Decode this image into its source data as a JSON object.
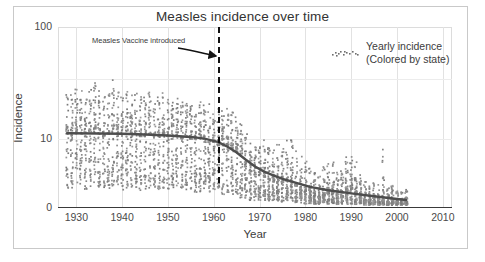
{
  "figure": {
    "title": "Measles incidence over time",
    "background": "#ffffff",
    "frame_color": "#c9c9c9"
  },
  "annotations": {
    "vaccine_label": "Measles Vaccine introduced",
    "vaccine_year": 1961,
    "arrow_color": "#111111",
    "dashed_line_color": "#111111"
  },
  "legend": {
    "title_line1": "Yearly incidence",
    "title_line2": "(Colored by state)",
    "marker": "scatter-dots-marker"
  },
  "chart_data": {
    "type": "scatter",
    "title": "Measles incidence over time",
    "xlabel": "Year",
    "ylabel": "Incidence",
    "xlim": [
      1926,
      2012
    ],
    "ylim": [
      0,
      100
    ],
    "xticks": [
      1930,
      1940,
      1950,
      1960,
      1970,
      1980,
      1990,
      2000,
      2010
    ],
    "xticklabels": [
      "1930",
      "1940",
      "1950",
      "1960",
      "1970",
      "1980",
      "1990",
      "2000",
      "2010"
    ],
    "yticks": [
      0,
      10,
      100
    ],
    "yticklabels": [
      "0",
      "10",
      "100"
    ],
    "yscale": "sqrt-like",
    "grid": "vertical gridlines at decades, faint horizontal at 10 and mid",
    "legend_position": "top-right inside panel",
    "point_color": "#6e6e6e",
    "point_marker": "small square",
    "point_size": 1.6,
    "series": [
      {
        "name": "Yearly incidence (Colored by state)",
        "description": "Per-state yearly measles incidence points, one vertical cluster per year",
        "x_range": [
          1928,
          2002
        ],
        "year_clusters": [
          {
            "year": 1928,
            "n": 42,
            "median": 12,
            "max": 38,
            "min": 0.5
          },
          {
            "year": 1929,
            "n": 44,
            "median": 11,
            "max": 34,
            "min": 0.4
          },
          {
            "year": 1930,
            "n": 45,
            "median": 13,
            "max": 40,
            "min": 0.6
          },
          {
            "year": 1931,
            "n": 45,
            "median": 12,
            "max": 36,
            "min": 0.5
          },
          {
            "year": 1932,
            "n": 46,
            "median": 11,
            "max": 33,
            "min": 0.4
          },
          {
            "year": 1933,
            "n": 46,
            "median": 13,
            "max": 42,
            "min": 0.5
          },
          {
            "year": 1934,
            "n": 47,
            "median": 14,
            "max": 45,
            "min": 0.7
          },
          {
            "year": 1935,
            "n": 47,
            "median": 12,
            "max": 39,
            "min": 0.5
          },
          {
            "year": 1936,
            "n": 47,
            "median": 11,
            "max": 36,
            "min": 0.4
          },
          {
            "year": 1937,
            "n": 48,
            "median": 12,
            "max": 38,
            "min": 0.5
          },
          {
            "year": 1938,
            "n": 48,
            "median": 14,
            "max": 47,
            "min": 0.6
          },
          {
            "year": 1939,
            "n": 48,
            "median": 12,
            "max": 35,
            "min": 0.5
          },
          {
            "year": 1940,
            "n": 48,
            "median": 11,
            "max": 33,
            "min": 0.4
          },
          {
            "year": 1941,
            "n": 48,
            "median": 13,
            "max": 40,
            "min": 0.5
          },
          {
            "year": 1942,
            "n": 48,
            "median": 12,
            "max": 36,
            "min": 0.5
          },
          {
            "year": 1943,
            "n": 48,
            "median": 12,
            "max": 34,
            "min": 0.4
          },
          {
            "year": 1944,
            "n": 48,
            "median": 11,
            "max": 32,
            "min": 0.4
          },
          {
            "year": 1945,
            "n": 48,
            "median": 11,
            "max": 31,
            "min": 0.4
          },
          {
            "year": 1946,
            "n": 48,
            "median": 12,
            "max": 35,
            "min": 0.5
          },
          {
            "year": 1947,
            "n": 48,
            "median": 11,
            "max": 30,
            "min": 0.4
          },
          {
            "year": 1948,
            "n": 48,
            "median": 11,
            "max": 32,
            "min": 0.4
          },
          {
            "year": 1949,
            "n": 48,
            "median": 12,
            "max": 34,
            "min": 0.5
          },
          {
            "year": 1950,
            "n": 48,
            "median": 11,
            "max": 30,
            "min": 0.4
          },
          {
            "year": 1951,
            "n": 48,
            "median": 10,
            "max": 29,
            "min": 0.4
          },
          {
            "year": 1952,
            "n": 48,
            "median": 11,
            "max": 31,
            "min": 0.4
          },
          {
            "year": 1953,
            "n": 48,
            "median": 10,
            "max": 28,
            "min": 0.3
          },
          {
            "year": 1954,
            "n": 48,
            "median": 11,
            "max": 30,
            "min": 0.4
          },
          {
            "year": 1955,
            "n": 48,
            "median": 10,
            "max": 28,
            "min": 0.3
          },
          {
            "year": 1956,
            "n": 48,
            "median": 10,
            "max": 27,
            "min": 0.3
          },
          {
            "year": 1957,
            "n": 48,
            "median": 10,
            "max": 29,
            "min": 0.3
          },
          {
            "year": 1958,
            "n": 49,
            "median": 9,
            "max": 26,
            "min": 0.3
          },
          {
            "year": 1959,
            "n": 50,
            "median": 9,
            "max": 27,
            "min": 0.3
          },
          {
            "year": 1960,
            "n": 51,
            "median": 9,
            "max": 25,
            "min": 0.3
          },
          {
            "year": 1961,
            "n": 51,
            "median": 8,
            "max": 24,
            "min": 0.3
          },
          {
            "year": 1962,
            "n": 51,
            "median": 8,
            "max": 23,
            "min": 0.2
          },
          {
            "year": 1963,
            "n": 51,
            "median": 8,
            "max": 24,
            "min": 0.2
          },
          {
            "year": 1964,
            "n": 51,
            "median": 7,
            "max": 22,
            "min": 0.2
          },
          {
            "year": 1965,
            "n": 51,
            "median": 6,
            "max": 20,
            "min": 0.2
          },
          {
            "year": 1966,
            "n": 51,
            "median": 5,
            "max": 17,
            "min": 0.1
          },
          {
            "year": 1967,
            "n": 51,
            "median": 3,
            "max": 12,
            "min": 0.1
          },
          {
            "year": 1968,
            "n": 51,
            "median": 2.2,
            "max": 9,
            "min": 0.05
          },
          {
            "year": 1969,
            "n": 51,
            "median": 1.8,
            "max": 8,
            "min": 0.05
          },
          {
            "year": 1970,
            "n": 51,
            "median": 1.6,
            "max": 9,
            "min": 0.05
          },
          {
            "year": 1971,
            "n": 51,
            "median": 1.5,
            "max": 10,
            "min": 0.05
          },
          {
            "year": 1972,
            "n": 51,
            "median": 1.2,
            "max": 8,
            "min": 0.04
          },
          {
            "year": 1973,
            "n": 51,
            "median": 1.0,
            "max": 7,
            "min": 0.04
          },
          {
            "year": 1974,
            "n": 51,
            "median": 0.9,
            "max": 9,
            "min": 0.03
          },
          {
            "year": 1975,
            "n": 51,
            "median": 1.0,
            "max": 12,
            "min": 0.03
          },
          {
            "year": 1976,
            "n": 51,
            "median": 1.1,
            "max": 14,
            "min": 0.03
          },
          {
            "year": 1977,
            "n": 51,
            "median": 1.0,
            "max": 11,
            "min": 0.03
          },
          {
            "year": 1978,
            "n": 51,
            "median": 0.7,
            "max": 7,
            "min": 0.02
          },
          {
            "year": 1979,
            "n": 51,
            "median": 0.4,
            "max": 5,
            "min": 0.02
          },
          {
            "year": 1980,
            "n": 51,
            "median": 0.3,
            "max": 4,
            "min": 0.01
          },
          {
            "year": 1981,
            "n": 51,
            "median": 0.2,
            "max": 3,
            "min": 0.01
          },
          {
            "year": 1982,
            "n": 51,
            "median": 0.15,
            "max": 2.5,
            "min": 0.01
          },
          {
            "year": 1983,
            "n": 51,
            "median": 0.12,
            "max": 2,
            "min": 0.01
          },
          {
            "year": 1984,
            "n": 51,
            "median": 0.2,
            "max": 3,
            "min": 0.01
          },
          {
            "year": 1985,
            "n": 51,
            "median": 0.25,
            "max": 3.5,
            "min": 0.01
          },
          {
            "year": 1986,
            "n": 51,
            "median": 0.3,
            "max": 4,
            "min": 0.01
          },
          {
            "year": 1987,
            "n": 51,
            "median": 0.2,
            "max": 3,
            "min": 0.01
          },
          {
            "year": 1988,
            "n": 51,
            "median": 0.15,
            "max": 2.5,
            "min": 0.01
          },
          {
            "year": 1989,
            "n": 51,
            "median": 0.4,
            "max": 5,
            "min": 0.01
          },
          {
            "year": 1990,
            "n": 51,
            "median": 0.5,
            "max": 6,
            "min": 0.01
          },
          {
            "year": 1991,
            "n": 51,
            "median": 0.3,
            "max": 4,
            "min": 0.01
          },
          {
            "year": 1992,
            "n": 51,
            "median": 0.1,
            "max": 2,
            "min": 0.01
          },
          {
            "year": 1993,
            "n": 51,
            "median": 0.05,
            "max": 1.2,
            "min": 0.005
          },
          {
            "year": 1994,
            "n": 51,
            "median": 0.05,
            "max": 1.0,
            "min": 0.005
          },
          {
            "year": 1995,
            "n": 51,
            "median": 0.04,
            "max": 0.9,
            "min": 0.005
          },
          {
            "year": 1996,
            "n": 51,
            "median": 0.04,
            "max": 1.0,
            "min": 0.005
          },
          {
            "year": 1997,
            "n": 51,
            "median": 0.06,
            "max": 8,
            "min": 0.005
          },
          {
            "year": 1998,
            "n": 51,
            "median": 0.03,
            "max": 0.8,
            "min": 0.005
          },
          {
            "year": 1999,
            "n": 51,
            "median": 0.03,
            "max": 0.7,
            "min": 0.005
          },
          {
            "year": 2000,
            "n": 51,
            "median": 0.02,
            "max": 0.6,
            "min": 0.005
          },
          {
            "year": 2001,
            "n": 51,
            "median": 0.02,
            "max": 0.5,
            "min": 0.005
          },
          {
            "year": 2002,
            "n": 51,
            "median": 0.02,
            "max": 0.5,
            "min": 0.005
          }
        ]
      }
    ],
    "trend_line": {
      "name": "Smoothed national trend",
      "color": "#4d4d4d",
      "width": 2.4,
      "x": [
        1928,
        1935,
        1940,
        1945,
        1950,
        1955,
        1958,
        1961,
        1963,
        1965,
        1967,
        1969,
        1971,
        1973,
        1975,
        1978,
        1981,
        1985,
        1990,
        1995,
        2000,
        2002
      ],
      "y": [
        12.2,
        12.1,
        12.0,
        11.7,
        11.3,
        10.8,
        10.2,
        9.0,
        7.6,
        6.0,
        4.3,
        3.0,
        2.2,
        1.7,
        1.3,
        0.9,
        0.6,
        0.4,
        0.25,
        0.15,
        0.08,
        0.06
      ]
    },
    "vline": {
      "x": 1961,
      "label": "Measles Vaccine introduced",
      "style": "dashed",
      "color": "#111111"
    }
  }
}
